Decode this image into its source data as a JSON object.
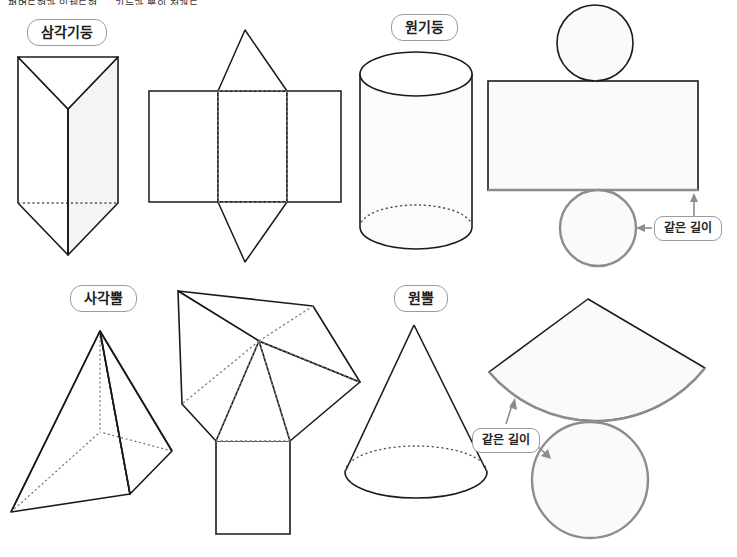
{
  "header": {
    "text": "평면도형과 입체도형 — 기둥과 뿔의 전개도"
  },
  "colors": {
    "ink": "#1a1a1a",
    "hidden_edge": "#6f6f6f",
    "highlight": "#8c8c8c",
    "face_fill": "#fbfbfb",
    "pill_border": "#9b9b9b",
    "pill_text": "#1d1d1d"
  },
  "figures": [
    {
      "id": "triangular-prism",
      "label": "삼각기둥",
      "solid": "triangular-prism-solid",
      "net": "triangular-prism-net"
    },
    {
      "id": "cylinder",
      "label": "원기둥",
      "solid": "cylinder-solid",
      "net": "cylinder-net"
    },
    {
      "id": "square-pyramid",
      "label": "사각뿔",
      "solid": "square-pyramid-solid",
      "net": "square-pyramid-net"
    },
    {
      "id": "cone",
      "label": "원뿔",
      "solid": "cone-solid",
      "net": "cone-net"
    }
  ],
  "callouts": [
    {
      "id": "cylinder-same-length",
      "text": "같은 길이",
      "arrows": [
        "up",
        "left"
      ]
    },
    {
      "id": "cone-same-length",
      "text": "같은 길이",
      "arrows": [
        "up",
        "down-right"
      ]
    }
  ]
}
